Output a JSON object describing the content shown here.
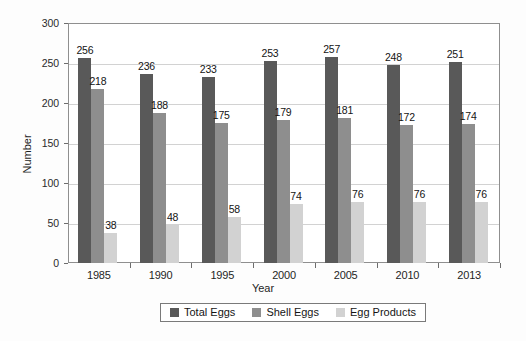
{
  "chart_data": {
    "type": "bar",
    "title": "",
    "xlabel": "Year",
    "ylabel": "Number",
    "categories": [
      "1985",
      "1990",
      "1995",
      "2000",
      "2005",
      "2010",
      "2013"
    ],
    "series": [
      {
        "name": "Total Eggs",
        "color": "#595959",
        "values": [
          256,
          236,
          233,
          253,
          257,
          248,
          251
        ]
      },
      {
        "name": "Shell Eggs",
        "color": "#8e8e8e",
        "values": [
          218,
          188,
          175,
          179,
          181,
          172,
          174
        ]
      },
      {
        "name": "Egg Products",
        "color": "#d2d2d2",
        "values": [
          38,
          48,
          58,
          74,
          76,
          76,
          76
        ]
      }
    ],
    "ylim": [
      0,
      300
    ],
    "yticks": [
      0,
      50,
      100,
      150,
      200,
      250,
      300
    ],
    "ytick_labels": [
      "0",
      "50",
      "100",
      "150",
      "200",
      "250",
      "300"
    ],
    "grid": true,
    "data_labels": true,
    "legend_position": "bottom",
    "legend_entries": [
      "Total Eggs",
      "Shell Eggs",
      "Egg Products"
    ]
  }
}
